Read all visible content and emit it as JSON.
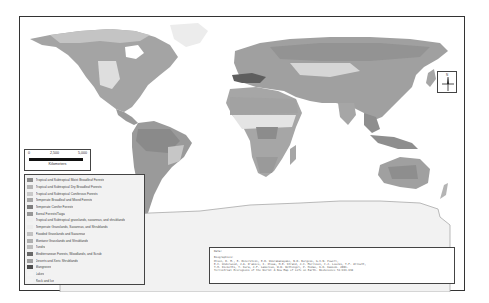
{
  "map": {
    "title": "Terrestrial Biomes of the World",
    "projection": "world",
    "colors": {
      "frame": "#333333",
      "land_default": "#a8a8a8",
      "ocean": "#ffffff",
      "antarctica": "#ececec",
      "tundra": "#c4c4c4",
      "boreal": "#9a9a9a",
      "desert": "#dedede",
      "tropical_moist": "#8c8c8c",
      "mediterranean": "#5e5e5e"
    }
  },
  "scale_bar": {
    "ticks": [
      "0",
      "2,500",
      "5,000"
    ],
    "unit": "Kilometers"
  },
  "north_arrow": {
    "label": "N"
  },
  "legend": {
    "items": [
      {
        "label": "Tropical and Subtropical Moist Broadleaf Forests",
        "color": "#8a8a8a"
      },
      {
        "label": "Tropical and Subtropical Dry Broadleaf Forests",
        "color": "#b4b4b4"
      },
      {
        "label": "Tropical and Subtropical Coniferous Forests",
        "color": "#c9c9c9"
      },
      {
        "label": "Temperate Broadleaf and Mixed Forests",
        "color": "#a6a6a6"
      },
      {
        "label": "Temperate Conifer Forests",
        "color": "#7e7e7e"
      },
      {
        "label": "Boreal Forests/Taiga",
        "color": "#979797"
      },
      {
        "label": "Tropical and Subtropical grasslands, savannas, and shrublands",
        "color": "#f0f0f0"
      },
      {
        "label": "Temperate Grasslands, Savannas, and Shrublands",
        "color": "#ececec"
      },
      {
        "label": "Flooded Grasslands and Savannas",
        "color": "#c2c2c2"
      },
      {
        "label": "Montane Grasslands and Shrublands",
        "color": "#b0b0b0"
      },
      {
        "label": "Tundra",
        "color": "#bdbdbd"
      },
      {
        "label": "Mediterranean Forests, Woodlands, and Scrub",
        "color": "#6a6a6a"
      },
      {
        "label": "Deserts and Xeric Shrublands",
        "color": "#a0a0a0"
      },
      {
        "label": "Mangroves",
        "color": "#4e4e4e"
      },
      {
        "label": "Lakes",
        "color": "#f4f4f4"
      },
      {
        "label": "Rock and Ice",
        "color": "#f4f4f4"
      }
    ]
  },
  "citation": {
    "title": "Data:",
    "heading": "Biographies:",
    "lines": [
      "Olson, D. M., E. Dinerstein, E.D. Wikramanayake, N.D. Burgess, G.V.N. Powell,",
      "E.C. Underwood, J.A. D'amico, I. Itoua, H.E. Strand, J.C. Morrison, C.J. Loucks, T.F. Allnutt,",
      "T.H. Ricketts, Y. Kura, J.F. Lamoreux, W.W. Wettengel, P. Hedao, K.R. Kassem. 2001.",
      "Terrestrial Ecoregions of the World: A New Map of Life on Earth. BioScience 51:933-938"
    ]
  }
}
